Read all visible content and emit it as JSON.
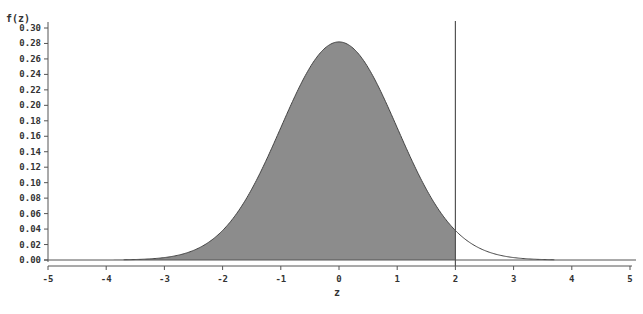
{
  "chart_data": {
    "type": "area",
    "title": "",
    "xlabel": "z",
    "ylabel": "f(z)",
    "xlim": [
      -5,
      5
    ],
    "ylim": [
      0.0,
      0.3
    ],
    "x_ticks": [
      -5,
      -4,
      -3,
      -2,
      -1,
      0,
      1,
      2,
      3,
      4,
      5
    ],
    "y_ticks": [
      "0.00",
      "0.02",
      "0.04",
      "0.06",
      "0.08",
      "0.10",
      "0.12",
      "0.14",
      "0.16",
      "0.18",
      "0.20",
      "0.22",
      "0.24",
      "0.26",
      "0.28",
      "0.30"
    ],
    "grid": false,
    "legend": null,
    "curve": {
      "description": "bell-shaped density curve centered at z=0",
      "peak": {
        "x": 0,
        "y": 0.282
      },
      "points": [
        {
          "x": -5,
          "y": 0.0
        },
        {
          "x": -4,
          "y": 0.0001
        },
        {
          "x": -3,
          "y": 0.0031
        },
        {
          "x": -2.5,
          "y": 0.0124
        },
        {
          "x": -2,
          "y": 0.0381
        },
        {
          "x": -1.5,
          "y": 0.0914
        },
        {
          "x": -1,
          "y": 0.1708
        },
        {
          "x": -0.5,
          "y": 0.2489
        },
        {
          "x": 0,
          "y": 0.282
        },
        {
          "x": 0.5,
          "y": 0.2489
        },
        {
          "x": 1,
          "y": 0.1708
        },
        {
          "x": 1.5,
          "y": 0.0914
        },
        {
          "x": 2,
          "y": 0.0381
        },
        {
          "x": 2.5,
          "y": 0.0124
        },
        {
          "x": 3,
          "y": 0.0031
        },
        {
          "x": 3.5,
          "y": 0.0006
        },
        {
          "x": 4,
          "y": 0.0001
        },
        {
          "x": 5,
          "y": 0.0
        }
      ]
    },
    "shaded_region": {
      "from": -5,
      "to": 2,
      "color": "#8c8c8c"
    },
    "annotations": [
      {
        "type": "vertical_line",
        "x": 2
      }
    ]
  },
  "labels": {
    "y_axis_title": "f(z)",
    "x_axis_title": "z"
  },
  "colors": {
    "fill": "#8c8c8c",
    "line": "#444444",
    "axis": "#555555"
  }
}
